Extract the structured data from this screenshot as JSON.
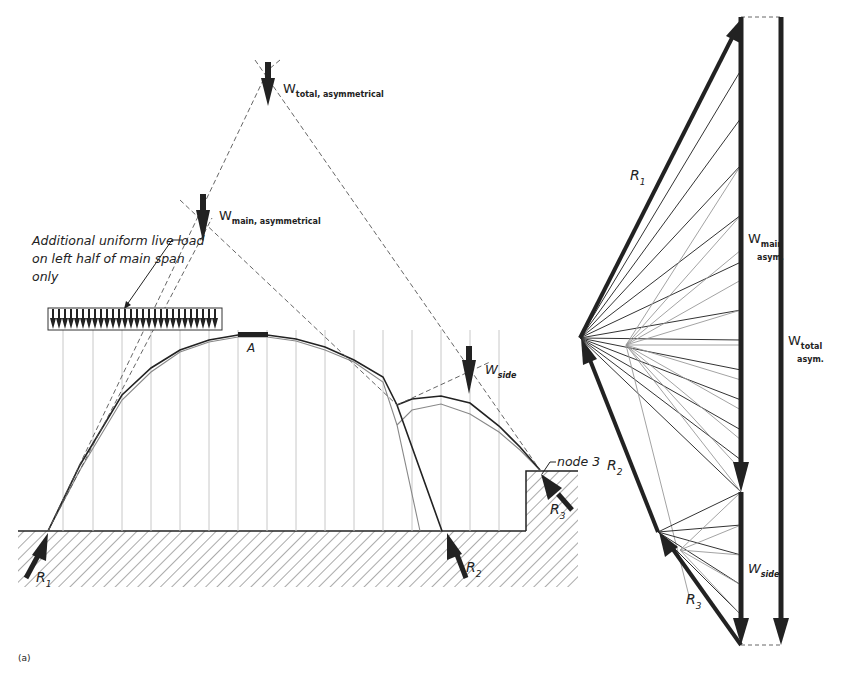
{
  "figure": {
    "label": "(a)"
  },
  "funicular": {
    "loads": {
      "total": {
        "symbol": "W",
        "subscript": "total, asymmetrical"
      },
      "main": {
        "symbol": "W",
        "subscript": "main, asymmetrical"
      },
      "side": {
        "symbol": "W",
        "subscript": "side"
      }
    },
    "live_load_note": {
      "line1": "Additional uniform live load",
      "line2": "on left half of main span",
      "line3": "only"
    },
    "crown_label": "A",
    "node_label": "node 3",
    "reactions": {
      "r1": {
        "symbol": "R",
        "subscript": "1"
      },
      "r2": {
        "symbol": "R",
        "subscript": "2"
      },
      "r3": {
        "symbol": "R",
        "subscript": "3"
      }
    }
  },
  "force_polygon": {
    "r1": {
      "symbol": "R",
      "subscript": "1"
    },
    "r2": {
      "symbol": "R",
      "subscript": "2"
    },
    "r3": {
      "symbol": "R",
      "subscript": "3"
    },
    "w_main": {
      "symbol": "W",
      "subscript": "main",
      "sub2": "asym."
    },
    "w_side": {
      "symbol": "W",
      "subscript": "side"
    },
    "w_total": {
      "symbol": "W",
      "subscript": "total",
      "sub2": "asym."
    }
  },
  "colors": {
    "ink": "#222222",
    "light_line": "#888888",
    "grid": "#c8c8c8",
    "hatch": "#555555"
  }
}
